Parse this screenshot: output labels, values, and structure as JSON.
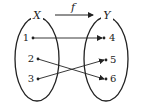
{
  "diagram": {
    "type": "function-mapping",
    "function_label": "f",
    "domain": {
      "label": "X",
      "elements": [
        "1",
        "2",
        "3"
      ]
    },
    "codomain": {
      "label": "Y",
      "elements": [
        "4",
        "5",
        "6"
      ]
    },
    "mappings": [
      {
        "from": "1",
        "to": "4"
      },
      {
        "from": "2",
        "to": "6"
      },
      {
        "from": "3",
        "to": "5"
      }
    ]
  }
}
